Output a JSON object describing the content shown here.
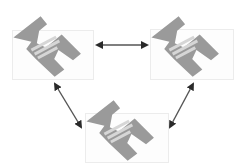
{
  "diagram": {
    "type": "network-triangle",
    "colors": {
      "background": "#ffffff",
      "icon_dark": "#8a8a8a",
      "icon_mid": "#a9a9a9",
      "icon_light": "#d4d4d4",
      "arrow": "#2a2a2a",
      "box_border": "#ececec"
    },
    "nodes": [
      {
        "id": "node-top-left",
        "icon": "computer-icon",
        "x": 12,
        "y": 12
      },
      {
        "id": "node-top-right",
        "icon": "computer-icon",
        "x": 150,
        "y": 12
      },
      {
        "id": "node-bottom",
        "icon": "computer-icon",
        "x": 85,
        "y": 96
      }
    ],
    "edges": [
      {
        "from": "node-top-left",
        "to": "node-top-right",
        "direction": "bidirectional",
        "x1": 97,
        "y1": 45,
        "x2": 147,
        "y2": 45
      },
      {
        "from": "node-top-left",
        "to": "node-bottom",
        "direction": "bidirectional",
        "x1": 55,
        "y1": 84,
        "x2": 81,
        "y2": 127
      },
      {
        "from": "node-top-right",
        "to": "node-bottom",
        "direction": "bidirectional",
        "x1": 193,
        "y1": 84,
        "x2": 170,
        "y2": 127
      }
    ]
  }
}
